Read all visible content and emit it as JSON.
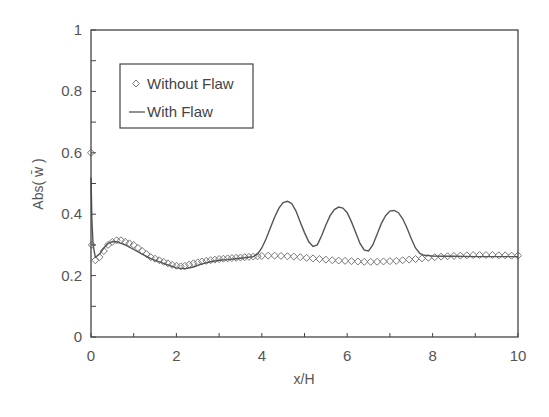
{
  "chart_data": {
    "type": "line",
    "title": "",
    "xlabel": "x/H",
    "ylabel": "Abs( w̄ )",
    "xlim": [
      0,
      10
    ],
    "ylim": [
      0,
      1
    ],
    "xticks": [
      0,
      2,
      4,
      6,
      8,
      10
    ],
    "xtick_labels": [
      "0",
      "2",
      "4",
      "6",
      "8",
      "10"
    ],
    "yticks": [
      0,
      0.2,
      0.4,
      0.6,
      0.8,
      1
    ],
    "ytick_labels": [
      "0",
      "0.2",
      "0.4",
      "0.6",
      "0.8",
      "1"
    ],
    "grid": false,
    "legend_position": "upper left",
    "series": [
      {
        "name": "Without Flaw",
        "style": "markers",
        "marker": "diamond-open",
        "x": [
          0.0,
          0.02,
          0.1,
          0.2,
          0.3,
          0.4,
          0.5,
          0.6,
          0.7,
          0.8,
          0.9,
          1.0,
          1.1,
          1.2,
          1.3,
          1.4,
          1.5,
          1.6,
          1.7,
          1.8,
          1.9,
          2.0,
          2.1,
          2.2,
          2.3,
          2.4,
          2.5,
          2.6,
          2.7,
          2.8,
          2.9,
          3.0,
          3.1,
          3.2,
          3.3,
          3.4,
          3.5,
          3.6,
          3.7,
          3.8,
          3.9,
          4.0,
          4.15,
          4.3,
          4.45,
          4.6,
          4.75,
          4.9,
          5.05,
          5.2,
          5.35,
          5.5,
          5.65,
          5.8,
          5.95,
          6.1,
          6.25,
          6.4,
          6.55,
          6.7,
          6.85,
          7.0,
          7.15,
          7.3,
          7.45,
          7.6,
          7.75,
          7.9,
          8.05,
          8.2,
          8.35,
          8.5,
          8.65,
          8.8,
          8.95,
          9.1,
          9.25,
          9.4,
          9.55,
          9.7,
          9.85,
          10.0
        ],
        "y": [
          0.6,
          0.3,
          0.25,
          0.26,
          0.28,
          0.3,
          0.31,
          0.315,
          0.315,
          0.31,
          0.305,
          0.3,
          0.29,
          0.28,
          0.27,
          0.26,
          0.255,
          0.25,
          0.245,
          0.24,
          0.235,
          0.232,
          0.23,
          0.232,
          0.236,
          0.24,
          0.243,
          0.246,
          0.248,
          0.25,
          0.252,
          0.254,
          0.255,
          0.256,
          0.257,
          0.258,
          0.259,
          0.26,
          0.261,
          0.262,
          0.263,
          0.264,
          0.265,
          0.265,
          0.264,
          0.263,
          0.262,
          0.26,
          0.258,
          0.256,
          0.254,
          0.252,
          0.25,
          0.249,
          0.248,
          0.247,
          0.246,
          0.245,
          0.245,
          0.245,
          0.246,
          0.247,
          0.248,
          0.25,
          0.252,
          0.254,
          0.256,
          0.258,
          0.26,
          0.262,
          0.263,
          0.264,
          0.265,
          0.266,
          0.267,
          0.267,
          0.267,
          0.267,
          0.266,
          0.266,
          0.265,
          0.265
        ]
      },
      {
        "name": "With Flaw",
        "style": "line",
        "x": [
          0.0,
          0.02,
          0.05,
          0.1,
          0.2,
          0.3,
          0.4,
          0.5,
          0.6,
          0.7,
          0.8,
          1.0,
          1.2,
          1.4,
          1.6,
          1.8,
          2.0,
          2.2,
          2.4,
          2.6,
          2.8,
          3.0,
          3.2,
          3.4,
          3.6,
          3.8,
          3.9,
          4.0,
          4.1,
          4.2,
          4.3,
          4.4,
          4.5,
          4.6,
          4.7,
          4.8,
          4.9,
          5.0,
          5.1,
          5.2,
          5.3,
          5.4,
          5.5,
          5.6,
          5.7,
          5.8,
          5.9,
          6.0,
          6.1,
          6.2,
          6.3,
          6.4,
          6.5,
          6.6,
          6.7,
          6.8,
          6.9,
          7.0,
          7.1,
          7.2,
          7.3,
          7.4,
          7.5,
          7.6,
          7.7,
          7.8,
          7.9,
          8.0,
          8.2,
          8.5,
          9.0,
          9.5,
          10.0
        ],
        "y": [
          0.52,
          0.38,
          0.3,
          0.26,
          0.27,
          0.29,
          0.305,
          0.31,
          0.31,
          0.305,
          0.3,
          0.285,
          0.27,
          0.255,
          0.245,
          0.235,
          0.225,
          0.222,
          0.228,
          0.238,
          0.245,
          0.25,
          0.252,
          0.255,
          0.258,
          0.262,
          0.27,
          0.29,
          0.32,
          0.355,
          0.39,
          0.42,
          0.438,
          0.442,
          0.435,
          0.41,
          0.375,
          0.34,
          0.31,
          0.295,
          0.3,
          0.33,
          0.365,
          0.395,
          0.415,
          0.423,
          0.42,
          0.405,
          0.375,
          0.34,
          0.305,
          0.283,
          0.28,
          0.3,
          0.335,
          0.37,
          0.395,
          0.41,
          0.412,
          0.405,
          0.385,
          0.355,
          0.32,
          0.29,
          0.272,
          0.266,
          0.265,
          0.264,
          0.263,
          0.263,
          0.262,
          0.262,
          0.262
        ]
      }
    ]
  },
  "legend": {
    "items": [
      {
        "label": "Without Flaw",
        "symbol": "diamond-open"
      },
      {
        "label": "With Flaw",
        "symbol": "line"
      }
    ]
  },
  "colors": {
    "axis": "#444444",
    "line": "#555555",
    "marker": "#777777",
    "text": "#555555"
  }
}
